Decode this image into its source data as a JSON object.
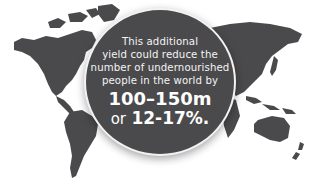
{
  "infographic": {
    "background_color": "#ffffff",
    "map_color": "#4a4a4c",
    "circle_color": "#4a4a4c",
    "text_color": "#ffffff",
    "lines": [
      "This additional",
      "yield could reduce the",
      "number of undernourished",
      "people in the world by"
    ],
    "highlight": "100–150m",
    "or_label": "or",
    "percentage": "12-17%."
  }
}
